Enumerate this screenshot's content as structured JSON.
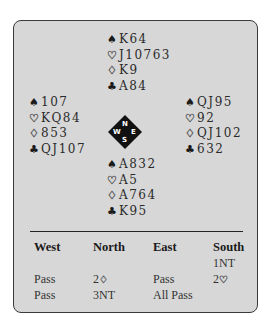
{
  "deal": {
    "north": {
      "spades": "K64",
      "hearts": "J10763",
      "diamonds": "K9",
      "clubs": "A84"
    },
    "west": {
      "spades": "107",
      "hearts": "KQ84",
      "diamonds": "853",
      "clubs": "QJ107"
    },
    "east": {
      "spades": "QJ95",
      "hearts": "92",
      "diamonds": "QJ102",
      "clubs": "632"
    },
    "south": {
      "spades": "A832",
      "hearts": "A5",
      "diamonds": "A764",
      "clubs": "K95"
    }
  },
  "suit_symbols": {
    "spades": "♠",
    "hearts": "♡",
    "diamonds": "♢",
    "clubs": "♣"
  },
  "compass": {
    "n": "N",
    "e": "E",
    "s": "S",
    "w": "W"
  },
  "bidding": {
    "headers": [
      "West",
      "North",
      "East",
      "South"
    ],
    "rows": [
      [
        "",
        "",
        "",
        "1NT"
      ],
      [
        "Pass",
        "2",
        "Pass",
        "2"
      ],
      [
        "Pass",
        "3NT",
        "All Pass",
        ""
      ]
    ],
    "row_suits": [
      [
        "",
        "",
        "",
        ""
      ],
      [
        "",
        "♢",
        "",
        "♡"
      ],
      [
        "",
        "",
        "",
        ""
      ]
    ]
  },
  "colors": {
    "panel_background": "#d7d7d7",
    "border": "#3a3a3a",
    "compass": "#111111"
  }
}
